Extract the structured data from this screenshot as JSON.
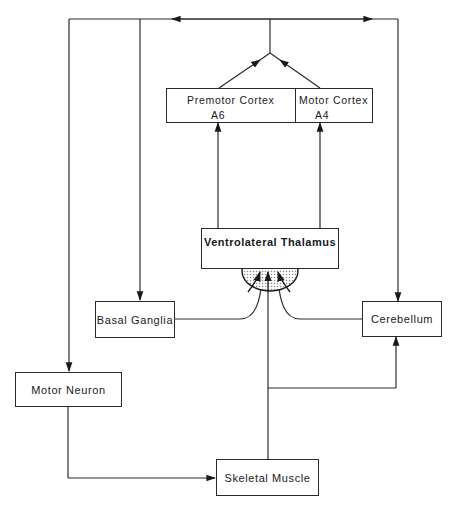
{
  "diagram": {
    "type": "motor-control-pathways",
    "nodes": {
      "premotor_cortex": {
        "label": "Premotor Cortex",
        "area": "A6"
      },
      "motor_cortex": {
        "label": "Motor Cortex",
        "area": "A4"
      },
      "ventrolateral_thalamus": {
        "label": "Ventrolateral Thalamus"
      },
      "basal_ganglia": {
        "label": "Basal Ganglia"
      },
      "cerebellum": {
        "label": "Cerebellum"
      },
      "motor_neuron": {
        "label": "Motor Neuron"
      },
      "skeletal_muscle": {
        "label": "Skeletal Muscle"
      }
    },
    "edges": [
      {
        "from": "Premotor Cortex",
        "to": "Cortical output bus"
      },
      {
        "from": "Motor Cortex",
        "to": "Cortical output bus"
      },
      {
        "from": "Cortical output bus",
        "to": "Motor Neuron"
      },
      {
        "from": "Cortical output bus",
        "to": "Basal Ganglia"
      },
      {
        "from": "Cortical output bus",
        "to": "Cerebellum"
      },
      {
        "from": "Ventrolateral Thalamus",
        "to": "Premotor Cortex"
      },
      {
        "from": "Ventrolateral Thalamus",
        "to": "Motor Cortex"
      },
      {
        "from": "Basal Ganglia",
        "to": "Ventrolateral Thalamus"
      },
      {
        "from": "Cerebellum",
        "to": "Ventrolateral Thalamus"
      },
      {
        "from": "Skeletal Muscle",
        "to": "Ventrolateral Thalamus"
      },
      {
        "from": "Skeletal Muscle",
        "to": "Cerebellum"
      },
      {
        "from": "Motor Neuron",
        "to": "Skeletal Muscle"
      }
    ],
    "colors": {
      "line": "#2a2a2a",
      "background": "#ffffff",
      "stipple": "#9a9a9a"
    }
  }
}
